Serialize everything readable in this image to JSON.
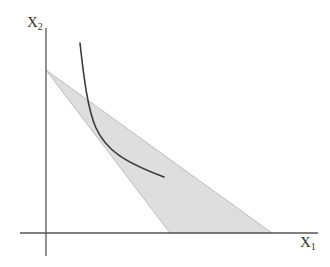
{
  "diagram": {
    "type": "economics-feasible-region-with-indifference-curve",
    "axes": {
      "y_label": "X",
      "y_label_sub": "2",
      "x_label": "X",
      "x_label_sub": "1"
    },
    "colors": {
      "axis": "#555555",
      "region_fill": "#dedede",
      "region_stroke": "#b8b8b8",
      "curve": "#3a3a3a",
      "text": "#333333"
    },
    "shaded_region": {
      "description": "triangle between two budget/constraint lines",
      "vertices": [
        [
          46,
          70
        ],
        [
          170,
          233
        ],
        [
          272,
          233
        ]
      ]
    },
    "curve": {
      "description": "convex indifference curve",
      "start": [
        80,
        43
      ],
      "end": [
        164,
        177
      ]
    }
  }
}
